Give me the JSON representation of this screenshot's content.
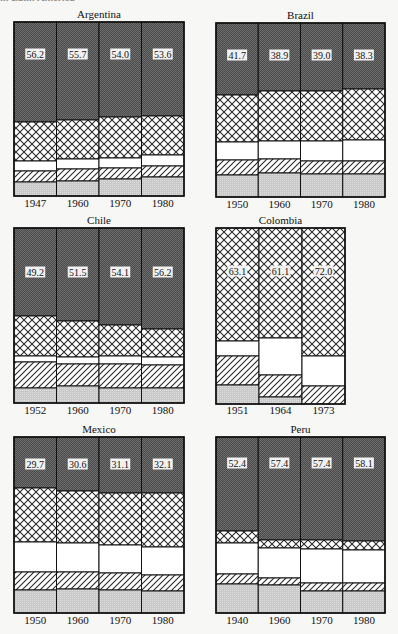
{
  "figure": {
    "clipped_header_text": "in Latin America",
    "segment_legend_order_top_to_bottom": [
      "dark-stipple",
      "crosshatch",
      "white",
      "diagonal-hatch",
      "light-stipple"
    ]
  },
  "colors": {
    "dark": "#4a4a4a",
    "dark_dot": "#6e6e6e",
    "cross_bg": "#ffffff",
    "cross_line": "#2a2a2a",
    "white": "#ffffff",
    "hatch_line": "#2a2a2a",
    "light": "#c9c9c9",
    "light_dot": "#dedede",
    "frame": "#111111",
    "label_bg": "#f2f2f2"
  },
  "chart_data": [
    {
      "type": "bar",
      "stacked": true,
      "title": "Argentina",
      "categories": [
        "1947",
        "1960",
        "1970",
        "1980"
      ],
      "labels": [
        "56.2",
        "55.7",
        "54.0",
        "53.6"
      ],
      "label_segment": "dark",
      "frame": {
        "x": 14,
        "y": 22,
        "w": 170,
        "h": 174
      },
      "segments_bottom_px": [
        {
          "dark": 122,
          "cross": 161,
          "white": 171,
          "hatch": 182
        },
        {
          "dark": 120,
          "cross": 159,
          "white": 169,
          "hatch": 181
        },
        {
          "dark": 117,
          "cross": 158,
          "white": 168,
          "hatch": 179
        },
        {
          "dark": 116,
          "cross": 155,
          "white": 166,
          "hatch": 177
        }
      ],
      "label_y": 54,
      "year_y": 207,
      "title_y": 18
    },
    {
      "type": "bar",
      "stacked": true,
      "title": "Brazil",
      "categories": [
        "1950",
        "1960",
        "1970",
        "1980"
      ],
      "labels": [
        "41.7",
        "38.9",
        "39.0",
        "38.3"
      ],
      "label_segment": "dark",
      "frame": {
        "x": 216,
        "y": 23,
        "w": 169,
        "h": 174
      },
      "segments_bottom_px": [
        {
          "dark": 95,
          "cross": 142,
          "white": 160,
          "hatch": 175
        },
        {
          "dark": 91,
          "cross": 141,
          "white": 159,
          "hatch": 173
        },
        {
          "dark": 91,
          "cross": 141,
          "white": 161,
          "hatch": 174
        },
        {
          "dark": 89,
          "cross": 140,
          "white": 161,
          "hatch": 174
        }
      ],
      "label_y": 55,
      "year_y": 208,
      "title_y": 19
    },
    {
      "type": "bar",
      "stacked": true,
      "title": "Chile",
      "categories": [
        "1952",
        "1960",
        "1970",
        "1980"
      ],
      "labels": [
        "49.2",
        "51.5",
        "54.1",
        "56.2"
      ],
      "label_segment": "dark",
      "frame": {
        "x": 14,
        "y": 228,
        "w": 170,
        "h": 175
      },
      "segments_bottom_px": [
        {
          "dark": 316,
          "cross": 356,
          "white": 362,
          "hatch": 388
        },
        {
          "dark": 321,
          "cross": 357,
          "white": 364,
          "hatch": 386
        },
        {
          "dark": 325,
          "cross": 356,
          "white": 364,
          "hatch": 388
        },
        {
          "dark": 329,
          "cross": 357,
          "white": 365,
          "hatch": 388
        }
      ],
      "label_y": 272,
      "year_y": 414,
      "title_y": 224
    },
    {
      "type": "bar",
      "stacked": true,
      "title": "Colombia",
      "categories": [
        "1951",
        "1964",
        "1973"
      ],
      "labels": [
        "63.1",
        "61.1",
        "72.0"
      ],
      "label_segment": "cross",
      "frame": {
        "x": 216,
        "y": 228,
        "w": 129,
        "h": 176
      },
      "segments_bottom_px": [
        {
          "dark": 228,
          "cross": 341,
          "white": 356,
          "hatch": 385
        },
        {
          "dark": 228,
          "cross": 338,
          "white": 375,
          "hatch": 397
        },
        {
          "dark": 228,
          "cross": 356,
          "white": 386,
          "hatch": 404
        }
      ],
      "label_y": 271,
      "year_y": 414,
      "title_y": 224
    },
    {
      "type": "bar",
      "stacked": true,
      "title": "Mexico",
      "categories": [
        "1950",
        "1960",
        "1970",
        "1980"
      ],
      "labels": [
        "29.7",
        "30.6",
        "31.1",
        "32.1"
      ],
      "label_segment": "dark",
      "frame": {
        "x": 14,
        "y": 437,
        "w": 170,
        "h": 176
      },
      "segments_bottom_px": [
        {
          "dark": 488,
          "cross": 542,
          "white": 572,
          "hatch": 590
        },
        {
          "dark": 491,
          "cross": 543,
          "white": 572,
          "hatch": 589
        },
        {
          "dark": 493,
          "cross": 545,
          "white": 573,
          "hatch": 590
        },
        {
          "dark": 493,
          "cross": 547,
          "white": 575,
          "hatch": 591
        }
      ],
      "label_y": 464,
      "year_y": 624,
      "title_y": 433
    },
    {
      "type": "bar",
      "stacked": true,
      "title": "Peru",
      "categories": [
        "1940",
        "1960",
        "1970",
        "1980"
      ],
      "labels": [
        "52.4",
        "57.4",
        "57.4",
        "58.1"
      ],
      "label_segment": "dark",
      "frame": {
        "x": 216,
        "y": 437,
        "w": 169,
        "h": 176
      },
      "segments_bottom_px": [
        {
          "dark": 531,
          "cross": 543,
          "white": 574,
          "hatch": 584
        },
        {
          "dark": 540,
          "cross": 548,
          "white": 578,
          "hatch": 585
        },
        {
          "dark": 540,
          "cross": 549,
          "white": 583,
          "hatch": 591
        },
        {
          "dark": 541,
          "cross": 550,
          "white": 583,
          "hatch": 591
        }
      ],
      "label_y": 463,
      "year_y": 624,
      "title_y": 433
    }
  ]
}
